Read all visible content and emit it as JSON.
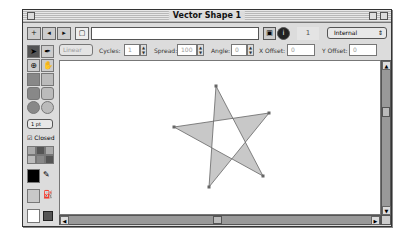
{
  "window": {
    "title": "Vector Shape 1"
  },
  "toolbar": {
    "add_label": "+",
    "prev_label": "◂",
    "next_label": "▸",
    "name_value": "",
    "page_number": "1",
    "storage_select": "Internal",
    "storage_arrow": "⇕",
    "script_icon": "▣",
    "info_icon": "i"
  },
  "options": {
    "gradient_type": "Linear",
    "cycles_label": "Cycles:",
    "cycles_value": "1",
    "spread_label": "Spread:",
    "spread_value": "100",
    "angle_label": "Angle:",
    "angle_value": "0",
    "xoffset_label": "X Offset:",
    "xoffset_value": "0",
    "yoffset_label": "Y Offset:",
    "yoffset_value": "0"
  },
  "tools": {
    "arrow": "➤",
    "pen": "✒",
    "registration": "⊕",
    "hand": "✋",
    "line_width": "1 pt",
    "closed_label": "Closed",
    "closed_checked": "☑",
    "stroke_color": "#000000",
    "fill_color": "#c8c8c8",
    "bg_color": "#ffffff"
  },
  "shape": {
    "type": "star",
    "points": [
      [
        216,
        86
      ],
      [
        263,
        176
      ],
      [
        174,
        127
      ],
      [
        269,
        113
      ],
      [
        209,
        187
      ]
    ],
    "fill": "#c8c8c8",
    "stroke": "#666666"
  },
  "colors": {
    "chrome": "#dcdcdc",
    "scroll": "#999999"
  }
}
